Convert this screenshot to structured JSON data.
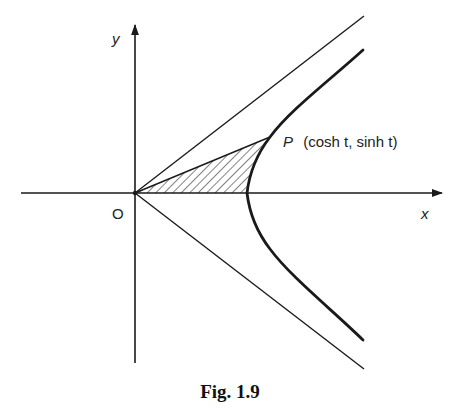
{
  "figure": {
    "caption": "Fig. 1.9",
    "x_axis_label": "x",
    "y_axis_label": "y",
    "origin_label": "O",
    "point": {
      "name": "P",
      "coords_label": "(cosh t, sinh t)",
      "full_label": "P (cosh t, sinh t)"
    },
    "curve": "x^2 - y^2 = 1 (right branch, x = cosh t, y = sinh t)",
    "asymptotes": [
      "y = x",
      "y = -x"
    ],
    "shaded_region": "region bounded by OP, the x-axis, and the hyperbola (hatched)",
    "colors": {
      "ink": "#1a1a1a",
      "background": "#ffffff"
    }
  }
}
